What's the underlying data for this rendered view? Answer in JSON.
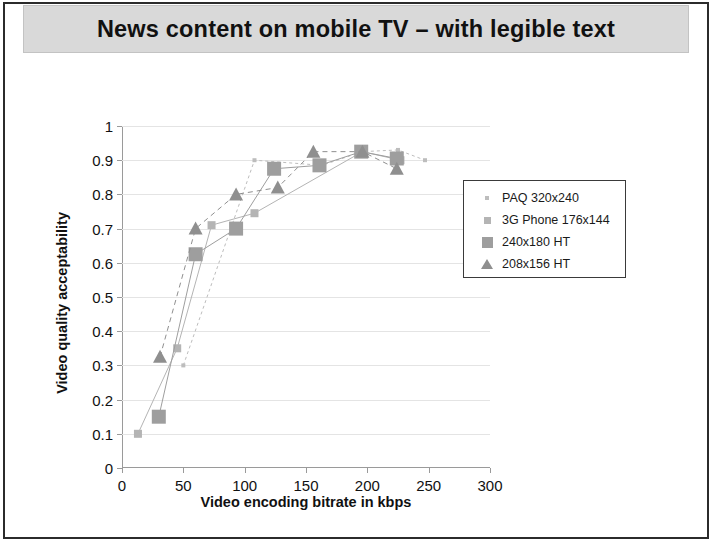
{
  "slide": {
    "title": "News content on mobile TV – with legible text"
  },
  "chart_data": {
    "type": "scatter",
    "title": "News content on mobile TV – with legible text",
    "xlabel": "Video encoding bitrate in kbps",
    "ylabel": "Video quality acceptability",
    "xlim": [
      0,
      300
    ],
    "ylim": [
      0,
      1
    ],
    "xticks": [
      0,
      50,
      100,
      150,
      200,
      250,
      300
    ],
    "yticks": [
      0,
      0.1,
      0.2,
      0.3,
      0.4,
      0.5,
      0.6,
      0.7,
      0.8,
      0.9,
      1
    ],
    "grid": "horizontal",
    "legend_position": "top-right",
    "series": [
      {
        "name": "PAQ 320x240",
        "marker": "dot",
        "color": "#bdbdbd",
        "points": [
          {
            "x": 50,
            "y": 0.3
          },
          {
            "x": 108,
            "y": 0.9
          },
          {
            "x": 163,
            "y": 0.885
          },
          {
            "x": 196,
            "y": 0.925
          },
          {
            "x": 225,
            "y": 0.93
          },
          {
            "x": 247,
            "y": 0.9
          }
        ]
      },
      {
        "name": "3G Phone 176x144",
        "marker": "square-small",
        "color": "#b4b4b4",
        "points": [
          {
            "x": 13,
            "y": 0.1
          },
          {
            "x": 45,
            "y": 0.35
          },
          {
            "x": 73,
            "y": 0.71
          },
          {
            "x": 108,
            "y": 0.745
          },
          {
            "x": 196,
            "y": 0.925
          },
          {
            "x": 227,
            "y": 0.9
          }
        ]
      },
      {
        "name": "240x180 HT",
        "marker": "square-large",
        "color": "#9e9e9e",
        "points": [
          {
            "x": 30,
            "y": 0.15
          },
          {
            "x": 60,
            "y": 0.625
          },
          {
            "x": 93,
            "y": 0.7
          },
          {
            "x": 124,
            "y": 0.875
          },
          {
            "x": 161,
            "y": 0.885
          },
          {
            "x": 195,
            "y": 0.925
          },
          {
            "x": 224,
            "y": 0.905
          }
        ]
      },
      {
        "name": "208x156 HT",
        "marker": "triangle",
        "color": "#8f8f8f",
        "points": [
          {
            "x": 31,
            "y": 0.325
          },
          {
            "x": 60,
            "y": 0.7
          },
          {
            "x": 93,
            "y": 0.8
          },
          {
            "x": 127,
            "y": 0.82
          },
          {
            "x": 156,
            "y": 0.925
          },
          {
            "x": 196,
            "y": 0.925
          },
          {
            "x": 224,
            "y": 0.875
          }
        ]
      }
    ]
  },
  "legend": {
    "items": [
      {
        "label": "PAQ 320x240",
        "key": "dot-marker"
      },
      {
        "label": "3G Phone 176x144",
        "key": "small-square-marker"
      },
      {
        "label": "240x180 HT",
        "key": "large-square-marker"
      },
      {
        "label": "208x156 HT",
        "key": "triangle-marker"
      }
    ]
  }
}
